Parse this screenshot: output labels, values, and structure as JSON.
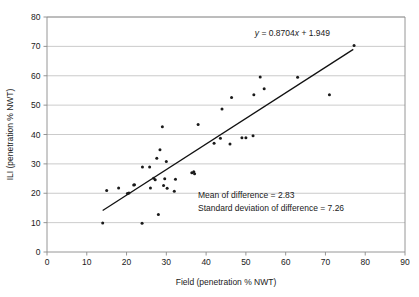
{
  "chart_data": {
    "type": "scatter",
    "title": "",
    "xlabel": "Field (penetration % NWT)",
    "ylabel": "ILI (penetration % NWT)",
    "xlim": [
      0,
      90
    ],
    "ylim": [
      0,
      80
    ],
    "xticks": [
      0,
      10,
      20,
      30,
      40,
      50,
      60,
      70,
      80,
      90
    ],
    "yticks": [
      0,
      10,
      20,
      30,
      40,
      50,
      60,
      70,
      80
    ],
    "grid": "horizontal",
    "legend": "none",
    "series": [
      {
        "name": "ILI vs Field",
        "marker": "filled-circle",
        "color": "#1a1a1a",
        "points": [
          [
            14.0,
            9.9
          ],
          [
            15.0,
            20.9
          ],
          [
            18.0,
            21.8
          ],
          [
            20.2,
            19.9
          ],
          [
            20.6,
            20.1
          ],
          [
            21.8,
            22.8
          ],
          [
            22.0,
            22.9
          ],
          [
            23.9,
            9.8
          ],
          [
            24.0,
            28.9
          ],
          [
            25.8,
            28.9
          ],
          [
            26.0,
            21.8
          ],
          [
            26.8,
            25.1
          ],
          [
            27.2,
            24.6
          ],
          [
            27.6,
            31.9
          ],
          [
            28.0,
            12.8
          ],
          [
            28.4,
            34.8
          ],
          [
            29.0,
            42.6
          ],
          [
            29.3,
            22.6
          ],
          [
            29.6,
            24.9
          ],
          [
            30.0,
            30.8
          ],
          [
            30.2,
            21.7
          ],
          [
            32.0,
            20.7
          ],
          [
            32.3,
            24.8
          ],
          [
            36.4,
            27.0
          ],
          [
            36.9,
            27.3
          ],
          [
            37.1,
            26.6
          ],
          [
            38.0,
            43.4
          ],
          [
            42.0,
            37.0
          ],
          [
            43.6,
            38.7
          ],
          [
            44.0,
            48.7
          ],
          [
            46.0,
            36.8
          ],
          [
            46.4,
            52.6
          ],
          [
            49.0,
            38.9
          ],
          [
            50.0,
            38.9
          ],
          [
            51.8,
            39.6
          ],
          [
            52.0,
            53.5
          ],
          [
            53.6,
            59.6
          ],
          [
            54.6,
            55.6
          ],
          [
            63.0,
            59.5
          ],
          [
            71.0,
            53.5
          ],
          [
            77.2,
            70.3
          ]
        ]
      }
    ],
    "trendline": {
      "equation_label": "y = 0.8704x + 1.949",
      "equation_y": "y",
      "equation_rest": " = 0.8704",
      "equation_x": "x",
      "equation_tail": " + 1.949",
      "slope": 0.8704,
      "intercept": 1.949,
      "x_start": 14.0,
      "x_end": 77.0
    },
    "annotations": [
      "Mean of difference = 2.83",
      "Standard deviation of difference = 7.26"
    ],
    "stats": {
      "mean_of_difference": 2.83,
      "standard_deviation_of_difference": 7.26
    }
  }
}
